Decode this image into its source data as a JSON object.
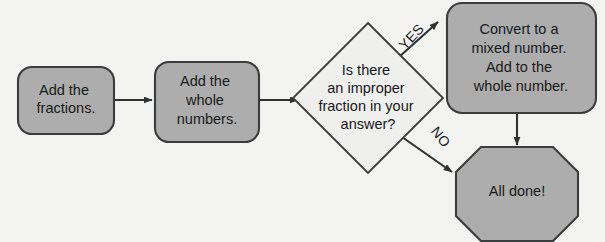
{
  "diagram": {
    "background_color": "#f3f3f2",
    "shape_fill_color": "#adadad",
    "shape_stroke_color": "#3a3c3d",
    "decision_fill_color": "#efefee",
    "text_color": "#17191a",
    "connector_color": "#2f3132"
  },
  "nodes": {
    "add_fractions": {
      "type": "rounded-rectangle",
      "lines": [
        "Add the",
        "fractions."
      ]
    },
    "add_whole_numbers": {
      "type": "rounded-rectangle",
      "lines": [
        "Add the",
        "whole",
        "numbers."
      ]
    },
    "decision": {
      "type": "diamond",
      "lines": [
        "Is there",
        "an improper",
        "fraction in your",
        "answer?"
      ]
    },
    "convert": {
      "type": "rounded-rectangle",
      "lines": [
        "Convert to a",
        "mixed number.",
        "Add to the",
        "whole number."
      ]
    },
    "all_done": {
      "type": "octagon",
      "lines": [
        "All done!"
      ]
    }
  },
  "edge_labels": {
    "yes": "YES",
    "no": "NO"
  }
}
